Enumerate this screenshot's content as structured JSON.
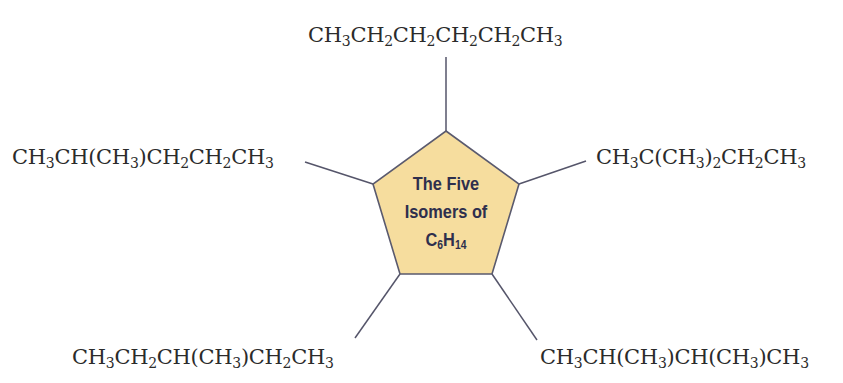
{
  "title": {
    "line1": "The Five",
    "line2": "Isomers of",
    "formula_base_c": "C",
    "formula_sub_c": "6",
    "formula_base_h": "H",
    "formula_sub_h": "14"
  },
  "colors": {
    "pentagon_fill": "#f6dd9e",
    "pentagon_stroke": "#5a5a6e",
    "connector": "#55556a",
    "title_text": "#2e2f4d",
    "formula_text": "#2b2b2b"
  },
  "isomers": [
    {
      "position": "top",
      "plain": "CH3CH2CH2CH2CH2CH3",
      "parts": [
        [
          "CH",
          "3"
        ],
        [
          "CH",
          "2"
        ],
        [
          "CH",
          "2"
        ],
        [
          "CH",
          "2"
        ],
        [
          "CH",
          "2"
        ],
        [
          "CH",
          "3"
        ]
      ]
    },
    {
      "position": "left",
      "plain": "CH3CH(CH3)CH2CH2CH3",
      "parts": [
        [
          "CH",
          "3"
        ],
        [
          "CH(CH",
          "3"
        ],
        [
          ")CH",
          "2"
        ],
        [
          "CH",
          "2"
        ],
        [
          "CH",
          "3"
        ]
      ]
    },
    {
      "position": "right",
      "plain": "CH3C(CH3)2CH2CH3",
      "parts": [
        [
          "CH",
          "3"
        ],
        [
          "C(CH",
          "3"
        ],
        [
          ")",
          "2"
        ],
        [
          "CH",
          "2"
        ],
        [
          "CH",
          "3"
        ]
      ]
    },
    {
      "position": "bottom-left",
      "plain": "CH3CH2CH(CH3)CH2CH3",
      "parts": [
        [
          "CH",
          "3"
        ],
        [
          "CH",
          "2"
        ],
        [
          "CH(CH",
          "3"
        ],
        [
          ")CH",
          "2"
        ],
        [
          "CH",
          "3"
        ]
      ]
    },
    {
      "position": "bottom-right",
      "plain": "CH3CH(CH3)CH(CH3)CH3",
      "parts": [
        [
          "CH",
          "3"
        ],
        [
          "CH(CH",
          "3"
        ],
        [
          ")CH(CH",
          "3"
        ],
        [
          ")CH",
          "3"
        ]
      ]
    }
  ]
}
